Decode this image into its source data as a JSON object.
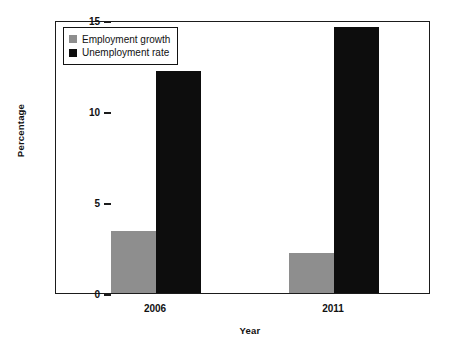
{
  "chart_data": {
    "type": "bar",
    "title": "",
    "subtitle": "",
    "xlabel": "Year",
    "ylabel": "Percentage",
    "categories": [
      "2006",
      "2011"
    ],
    "series": [
      {
        "name": "Employment growth",
        "color": "#8e8e8e",
        "values": [
          3.4,
          2.2
        ]
      },
      {
        "name": "Unemployment rate",
        "color": "#0d0d0d",
        "values": [
          12.2,
          14.6
        ]
      }
    ],
    "ylim": [
      0,
      15
    ],
    "yticks": [
      0,
      5,
      10,
      15
    ],
    "ytick_labels": [
      "0",
      "5",
      "10",
      "15"
    ],
    "grid": false,
    "legend_position": "top-left",
    "legend_entries": [
      "Employment growth",
      "Unemployment rate"
    ],
    "axis_color": "#1b1b1b",
    "background_color": "#ffffff"
  }
}
